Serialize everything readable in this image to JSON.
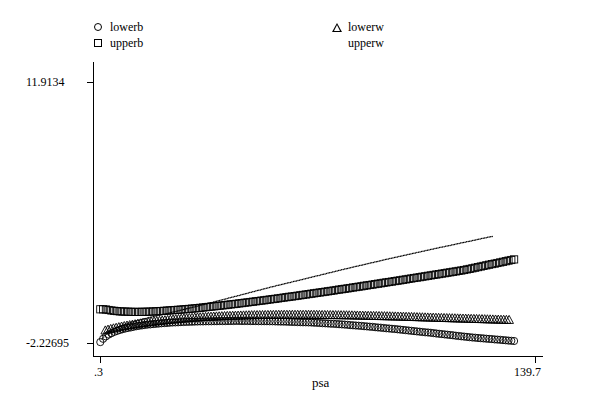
{
  "chart_data": {
    "type": "scatter",
    "title": "",
    "subtitle": "",
    "xlabel": "psa",
    "ylabel": "",
    "xlim": [
      0.3,
      139.7
    ],
    "ylim": [
      -2.22695,
      11.9134
    ],
    "xticklabels": [
      "0.3",
      "139.7"
    ],
    "yticklabels": [
      "11.9134",
      "-2.22695"
    ],
    "grid": false,
    "legend_position": "top",
    "legend": [
      {
        "name": "lowerb",
        "marker": "circle"
      },
      {
        "name": "upperb",
        "marker": "square"
      },
      {
        "name": "lowerw",
        "marker": "triangle"
      },
      {
        "name": "upperw",
        "marker": "dot"
      }
    ],
    "series": [
      {
        "name": "lowerb",
        "marker": "circle",
        "points": [
          [
            0.4,
            -2.18
          ],
          [
            0.5,
            -2.16
          ],
          [
            0.6,
            -2.14
          ],
          [
            0.7,
            -2.12
          ],
          [
            0.8,
            -2.1
          ],
          [
            0.9,
            -2.08
          ],
          [
            1.0,
            -2.06
          ],
          [
            1.1,
            -2.04
          ],
          [
            1.2,
            -2.02
          ],
          [
            1.3,
            -2.0
          ],
          [
            1.5,
            -1.97
          ],
          [
            1.7,
            -1.94
          ],
          [
            1.9,
            -1.91
          ],
          [
            2.1,
            -1.88
          ],
          [
            2.3,
            -1.85
          ],
          [
            2.6,
            -1.82
          ],
          [
            2.9,
            -1.79
          ],
          [
            3.2,
            -1.76
          ],
          [
            3.5,
            -1.73
          ],
          [
            3.9,
            -1.7
          ],
          [
            4.3,
            -1.67
          ],
          [
            4.8,
            -1.63
          ],
          [
            5.3,
            -1.6
          ],
          [
            5.9,
            -1.56
          ],
          [
            6.5,
            -1.53
          ],
          [
            7.2,
            -1.49
          ],
          [
            8.0,
            -1.46
          ],
          [
            8.9,
            -1.42
          ],
          [
            9.9,
            -1.39
          ],
          [
            11.0,
            -1.35
          ],
          [
            12.2,
            -1.31
          ],
          [
            13.6,
            -1.28
          ],
          [
            15.1,
            -1.24
          ],
          [
            16.8,
            -1.21
          ],
          [
            18.7,
            -1.18
          ],
          [
            20.8,
            -1.15
          ],
          [
            23.2,
            -1.12
          ],
          [
            25.8,
            -1.1
          ],
          [
            28.7,
            -1.08
          ],
          [
            32.0,
            -1.06
          ],
          [
            35.6,
            -1.05
          ],
          [
            39.7,
            -1.04
          ],
          [
            44.2,
            -1.03
          ],
          [
            49.3,
            -1.04
          ],
          [
            55.0,
            -1.05
          ],
          [
            61.3,
            -1.08
          ],
          [
            68.4,
            -1.12
          ],
          [
            76.4,
            -1.2
          ],
          [
            85.3,
            -1.32
          ],
          [
            95.3,
            -1.48
          ],
          [
            106.5,
            -1.68
          ],
          [
            119.1,
            -1.92
          ],
          [
            133.0,
            -2.12
          ]
        ]
      },
      {
        "name": "upperb",
        "marker": "square",
        "points": [
          [
            0.4,
            -0.4
          ],
          [
            0.6,
            -0.4
          ],
          [
            0.8,
            -0.4
          ],
          [
            1.0,
            -0.4
          ],
          [
            1.3,
            -0.4
          ],
          [
            1.6,
            -0.4
          ],
          [
            2.0,
            -0.41
          ],
          [
            2.5,
            -0.42
          ],
          [
            3.1,
            -0.44
          ],
          [
            3.8,
            -0.46
          ],
          [
            4.7,
            -0.48
          ],
          [
            5.8,
            -0.5
          ],
          [
            7.1,
            -0.52
          ],
          [
            8.7,
            -0.53
          ],
          [
            10.6,
            -0.54
          ],
          [
            13.0,
            -0.54
          ],
          [
            15.9,
            -0.53
          ],
          [
            19.4,
            -0.5
          ],
          [
            23.7,
            -0.45
          ],
          [
            28.9,
            -0.38
          ],
          [
            35.3,
            -0.27
          ],
          [
            43.1,
            -0.12
          ],
          [
            52.6,
            0.08
          ],
          [
            64.2,
            0.35
          ],
          [
            78.4,
            0.7
          ],
          [
            95.7,
            1.15
          ],
          [
            116.8,
            1.72
          ],
          [
            133.0,
            2.3
          ]
        ]
      },
      {
        "name": "lowerw",
        "marker": "triangle",
        "points": [
          [
            2.0,
            -1.55
          ],
          [
            3.0,
            -1.5
          ],
          [
            4.2,
            -1.45
          ],
          [
            5.6,
            -1.4
          ],
          [
            7.2,
            -1.34
          ],
          [
            9.1,
            -1.28
          ],
          [
            11.3,
            -1.22
          ],
          [
            13.9,
            -1.15
          ],
          [
            16.9,
            -1.08
          ],
          [
            20.4,
            -1.01
          ],
          [
            24.5,
            -0.94
          ],
          [
            29.3,
            -0.87
          ],
          [
            34.9,
            -0.81
          ],
          [
            41.4,
            -0.76
          ],
          [
            49.0,
            -0.72
          ],
          [
            57.9,
            -0.7
          ],
          [
            68.3,
            -0.7
          ],
          [
            80.5,
            -0.73
          ],
          [
            94.8,
            -0.79
          ],
          [
            111.6,
            -0.88
          ],
          [
            131.4,
            -0.98
          ]
        ]
      },
      {
        "name": "upperw",
        "marker": "dot",
        "points": [
          [
            1.0,
            -2.0
          ],
          [
            2.0,
            -1.8
          ],
          [
            3.5,
            -1.6
          ],
          [
            5.0,
            -1.45
          ],
          [
            7.0,
            -1.3
          ],
          [
            9.5,
            -1.15
          ],
          [
            12.5,
            -1.0
          ],
          [
            16.0,
            -0.85
          ],
          [
            20.0,
            -0.7
          ],
          [
            25.0,
            -0.5
          ],
          [
            31.0,
            -0.25
          ],
          [
            38.0,
            0.05
          ],
          [
            46.0,
            0.4
          ],
          [
            55.0,
            0.8
          ],
          [
            66.0,
            1.25
          ],
          [
            78.0,
            1.75
          ],
          [
            92.0,
            2.3
          ],
          [
            108.0,
            2.9
          ],
          [
            126.0,
            3.55
          ]
        ]
      }
    ]
  },
  "legend": {
    "lowerb": "lowerb",
    "upperb": "upperb",
    "lowerw": "lowerw",
    "upperw": "upperw"
  },
  "axes": {
    "y_top_label": "11.9134",
    "y_bottom_label": "-2.22695",
    "x_left_label": ".3",
    "x_right_label": "139.7",
    "x_axis_title": "psa"
  }
}
